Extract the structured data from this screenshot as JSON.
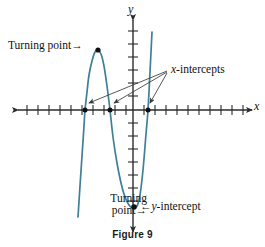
{
  "figure": {
    "caption": "Figure 9",
    "axis_x_label": "x",
    "axis_y_label": "y",
    "background_color": "#ffffff",
    "curve_color": "#3f7f98",
    "axis_color": "#2b2b2b",
    "annotation_color": "#3a3a3a"
  },
  "annotations": {
    "turning_point_top": "Turning point",
    "turning_point_top_arrow": "→",
    "turning_point_bottom_line1": "Turning",
    "turning_point_bottom_line2": "point",
    "turning_point_bottom_arrow": "→",
    "x_intercepts": "x-intercepts",
    "x_intercepts_prefix": "x",
    "x_intercepts_suffix": "-intercepts",
    "y_intercept_arrow": "←",
    "y_intercept_prefix": "y",
    "y_intercept_suffix": "-intercept"
  },
  "chart_data": {
    "type": "line",
    "title": "Figure 9",
    "xlabel": "x",
    "ylabel": "y",
    "grid": false,
    "legend": "none",
    "axis_style": "double-arrow number line with tick marks",
    "x_tick_count": 20,
    "y_tick_count": 14,
    "x_tick_spacing_px": 11,
    "y_tick_spacing_px": 13,
    "origin_px": [
      133,
      110
    ],
    "features": {
      "x_intercepts_px": [
        [
          85,
          110
        ],
        [
          110,
          110
        ],
        [
          148,
          110
        ]
      ],
      "turning_point_max_px": [
        98,
        50
      ],
      "turning_point_min_px": [
        136,
        207
      ],
      "y_intercept_px": [
        133,
        208
      ]
    },
    "curve_points_px": [
      [
        78,
        217
      ],
      [
        80,
        186
      ],
      [
        82,
        156
      ],
      [
        84,
        126
      ],
      [
        85,
        110
      ],
      [
        87,
        92
      ],
      [
        89,
        75
      ],
      [
        92,
        61
      ],
      [
        95,
        52
      ],
      [
        98,
        50
      ],
      [
        101,
        54
      ],
      [
        104,
        66
      ],
      [
        107,
        86
      ],
      [
        110,
        110
      ],
      [
        113,
        137
      ],
      [
        117,
        163
      ],
      [
        121,
        183
      ],
      [
        125,
        197
      ],
      [
        129,
        205
      ],
      [
        133,
        208
      ],
      [
        137,
        206
      ],
      [
        140,
        195
      ],
      [
        143,
        170
      ],
      [
        146,
        134
      ],
      [
        148,
        110
      ],
      [
        150,
        72
      ],
      [
        152,
        32
      ]
    ],
    "annotation_arrows": [
      {
        "name": "x-intercept-arrow-1",
        "from_px": [
          167,
          72
        ],
        "to_px": [
          88,
          104
        ]
      },
      {
        "name": "x-intercept-arrow-2",
        "from_px": [
          167,
          72
        ],
        "to_px": [
          113,
          104
        ]
      },
      {
        "name": "x-intercept-arrow-3",
        "from_px": [
          167,
          72
        ],
        "to_px": [
          150,
          104
        ]
      }
    ]
  }
}
